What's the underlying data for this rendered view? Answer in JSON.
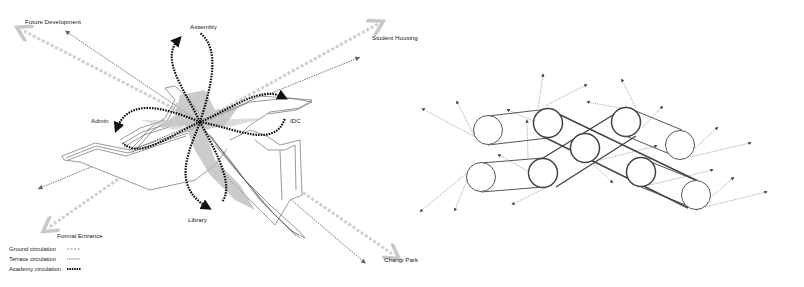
{
  "diagram": {
    "left_panel": {
      "destinations": {
        "future_development": "Future Development",
        "student_housing": "Student Housing",
        "formal_entrance": "Formal Entrance",
        "changi_park": "Changi Park"
      },
      "nodes": {
        "assembly": "Assembly",
        "admin": "Admin",
        "idc": "IDC",
        "library": "Library"
      },
      "legend": [
        {
          "label": "Ground circulation",
          "style": "light-grey-wide-dashed",
          "color": "#c8c8c8"
        },
        {
          "label": "Terrace circulation",
          "style": "grey-fine-dashed",
          "color": "#777777"
        },
        {
          "label": "Academy circulation",
          "style": "black-bold-dashed",
          "color": "#111111"
        }
      ]
    },
    "right_panel": {
      "description": "Network of nine circular nodes connected by belt-like bands forming an X pattern, with dotted arrows radiating outward",
      "node_count": 9
    },
    "colors": {
      "ground": "#c8c8c8",
      "terrace": "#777777",
      "academy": "#111111",
      "building_shade": "#b5b5b5",
      "outline": "#555555"
    }
  }
}
